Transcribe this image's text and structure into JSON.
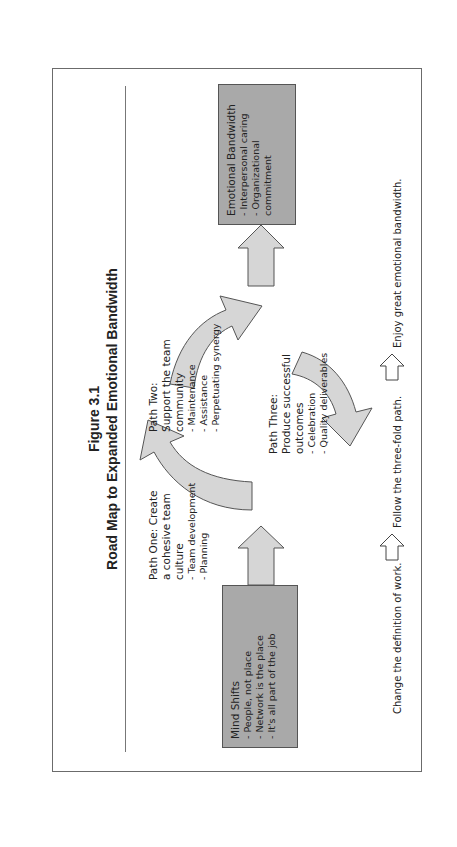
{
  "figure": {
    "number": "Figure 3.1",
    "title": "Road Map to Expanded Emotional Bandwidth",
    "orientation": "rotated 90 degrees counter-clockwise"
  },
  "boxes": {
    "mind_shifts": {
      "heading": "Mind Shifts",
      "items": [
        "- People, not place",
        "- Network is the place",
        "- It's all part of the job"
      ]
    },
    "emotional_bandwidth": {
      "heading": "Emotional Bandwidth",
      "items": [
        "- Interpersonal caring",
        "- Organizational commitment"
      ]
    }
  },
  "paths": {
    "one": {
      "heading_lines": [
        "Path One: Create",
        "a cohesive team",
        "culture"
      ],
      "items": [
        "- Team development",
        "- Planning"
      ]
    },
    "two": {
      "heading_lines": [
        "Path Two:",
        "Support the team",
        "community"
      ],
      "items": [
        "- Maintenance",
        "- Assistance",
        "- Perpetuating synergy"
      ]
    },
    "three": {
      "heading_lines": [
        "Path Three:",
        "Produce successful",
        "outcomes"
      ],
      "items": [
        "- Celebration",
        "- Quality deliverables"
      ]
    }
  },
  "legend": {
    "step1": "Change the definition of work.",
    "step2": "Follow the three-fold path.",
    "step3": "Enjoy great emotional bandwidth."
  },
  "colors": {
    "box_fill": "#a9a9a9",
    "arrow_fill": "#d6d6d6",
    "stroke": "#555555",
    "frame": "#6b6b6b"
  }
}
